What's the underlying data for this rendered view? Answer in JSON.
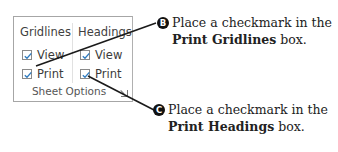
{
  "ribbon_group": {
    "name": "Sheet Options",
    "columns": [
      {
        "title": "Gridlines",
        "options": [
          {
            "label": "View",
            "checked": true
          },
          {
            "label": "Print",
            "checked": true
          }
        ]
      },
      {
        "title": "Headings",
        "options": [
          {
            "label": "View",
            "checked": true
          },
          {
            "label": "Print",
            "checked": true
          }
        ]
      }
    ],
    "launcher_icon": "dialog-launcher-icon"
  },
  "callouts": [
    {
      "badge": "B",
      "line1": "Place a checkmark in the",
      "bold": "Print Gridlines",
      "rest": " box."
    },
    {
      "badge": "C",
      "line1": "Place a checkmark in the",
      "bold": "Print Headings",
      "rest": " box."
    }
  ],
  "colors": {
    "checkmark": "#2f7bbf",
    "badge": "#111111",
    "leader_line": "#1a1a1a"
  }
}
